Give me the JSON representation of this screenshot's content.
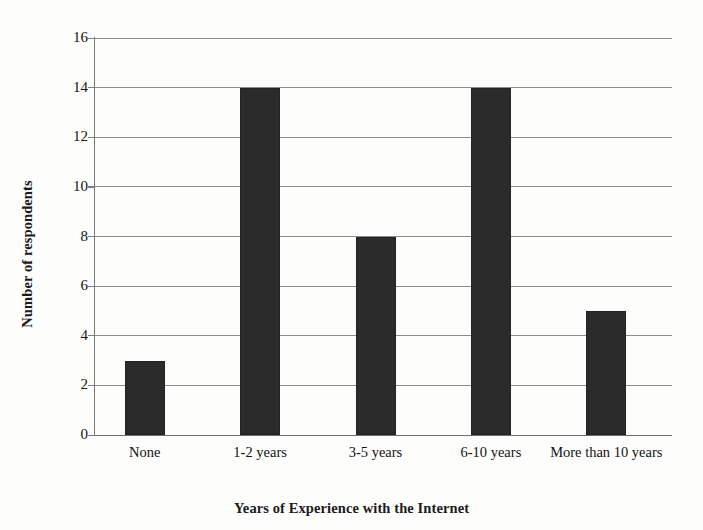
{
  "chart_data": {
    "type": "bar",
    "title": "",
    "subtitle": "",
    "xlabel": "Years of Experience with the Internet",
    "ylabel": "Number of respondents",
    "categories": [
      "None",
      "1-2 years",
      "3-5 years",
      "6-10 years",
      "More than 10 years"
    ],
    "values": [
      3,
      14,
      8,
      14,
      5
    ],
    "ylim": [
      0,
      16
    ],
    "y_tick_step": 2,
    "y_tick_labels": [
      "16",
      "14",
      "12",
      "10",
      "8",
      "6",
      "4",
      "2",
      "0"
    ],
    "y_tick_values": [
      16,
      14,
      12,
      10,
      8,
      6,
      4,
      2,
      0
    ],
    "grid": "horizontal",
    "legend": "none",
    "bar_color": "#2b2b2b",
    "gridline_color": "#8d8d8d",
    "axis_color": "#7a7a7a",
    "background_color": "#fdfdfc"
  }
}
